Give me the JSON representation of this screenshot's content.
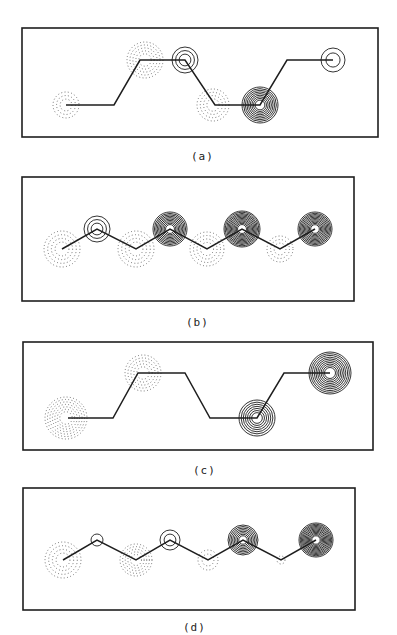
{
  "colors": {
    "ink": "#1e1e1e",
    "dotted": "#555555",
    "background": "#ffffff"
  },
  "panels": [
    {
      "id": "a",
      "label": "(a)",
      "label_pos": [
        191,
        150
      ],
      "box": [
        22,
        28,
        356,
        109
      ],
      "path": [
        [
          66,
          105
        ],
        [
          114,
          105
        ],
        [
          140,
          60
        ],
        [
          185,
          60
        ],
        [
          215,
          105
        ],
        [
          260,
          105
        ],
        [
          287,
          60
        ],
        [
          333,
          60
        ]
      ],
      "atoms": [
        {
          "x": 66,
          "y": 105,
          "phase": "negative",
          "rings": 3,
          "radius": 13
        },
        {
          "x": 145,
          "y": 60,
          "phase": "negative",
          "rings": 5,
          "radius": 18
        },
        {
          "x": 185,
          "y": 60,
          "phase": "positive",
          "rings": 3,
          "radius": 13
        },
        {
          "x": 213,
          "y": 105,
          "phase": "negative",
          "rings": 4,
          "radius": 16
        },
        {
          "x": 260,
          "y": 105,
          "phase": "positive",
          "rings": 9,
          "radius": 18
        },
        {
          "x": 333,
          "y": 60,
          "phase": "positive",
          "rings": 2,
          "radius": 12
        }
      ]
    },
    {
      "id": "b",
      "label": "(b)",
      "label_pos": [
        186,
        316
      ],
      "box": [
        22,
        177,
        332,
        124
      ],
      "path": [
        [
          62,
          249
        ],
        [
          97,
          229
        ],
        [
          136,
          249
        ],
        [
          170,
          229
        ],
        [
          207,
          249
        ],
        [
          242,
          229
        ],
        [
          280,
          249
        ],
        [
          315,
          229
        ]
      ],
      "atoms": [
        {
          "x": 62,
          "y": 249,
          "phase": "negative",
          "rings": 4,
          "radius": 18
        },
        {
          "x": 97,
          "y": 229,
          "phase": "positive",
          "rings": 3,
          "radius": 13
        },
        {
          "x": 136,
          "y": 249,
          "phase": "negative",
          "rings": 4,
          "radius": 18
        },
        {
          "x": 170,
          "y": 229,
          "phase": "positive",
          "rings": 10,
          "radius": 17
        },
        {
          "x": 207,
          "y": 249,
          "phase": "negative",
          "rings": 4,
          "radius": 17
        },
        {
          "x": 242,
          "y": 229,
          "phase": "positive",
          "rings": 12,
          "radius": 18
        },
        {
          "x": 280,
          "y": 249,
          "phase": "negative",
          "rings": 3,
          "radius": 13
        },
        {
          "x": 315,
          "y": 229,
          "phase": "positive",
          "rings": 11,
          "radius": 17
        }
      ]
    },
    {
      "id": "c",
      "label": "(c)",
      "label_pos": [
        193,
        464
      ],
      "box": [
        23,
        342,
        350,
        108
      ],
      "path": [
        [
          68,
          418
        ],
        [
          113,
          418
        ],
        [
          138,
          373
        ],
        [
          185,
          373
        ],
        [
          210,
          418
        ],
        [
          257,
          418
        ],
        [
          284,
          373
        ],
        [
          330,
          373
        ]
      ],
      "atoms": [
        {
          "x": 66,
          "y": 418,
          "phase": "negative",
          "rings": 7,
          "radius": 21
        },
        {
          "x": 143,
          "y": 373,
          "phase": "negative",
          "rings": 5,
          "radius": 18
        },
        {
          "x": 257,
          "y": 418,
          "phase": "positive",
          "rings": 7,
          "radius": 18
        },
        {
          "x": 330,
          "y": 373,
          "phase": "positive",
          "rings": 10,
          "radius": 21
        }
      ]
    },
    {
      "id": "d",
      "label": "(d)",
      "label_pos": [
        183,
        621
      ],
      "box": [
        23,
        488,
        332,
        122
      ],
      "path": [
        [
          63,
          560
        ],
        [
          97,
          540
        ],
        [
          136,
          560
        ],
        [
          170,
          540
        ],
        [
          208,
          560
        ],
        [
          243,
          540
        ],
        [
          281,
          560
        ],
        [
          316,
          540
        ]
      ],
      "atoms": [
        {
          "x": 63,
          "y": 560,
          "phase": "negative",
          "rings": 4,
          "radius": 18
        },
        {
          "x": 97,
          "y": 540,
          "phase": "positive",
          "rings": 1,
          "radius": 6
        },
        {
          "x": 136,
          "y": 560,
          "phase": "negative",
          "rings": 5,
          "radius": 16
        },
        {
          "x": 170,
          "y": 540,
          "phase": "positive",
          "rings": 2,
          "radius": 10
        },
        {
          "x": 208,
          "y": 560,
          "phase": "negative",
          "rings": 2,
          "radius": 10
        },
        {
          "x": 243,
          "y": 540,
          "phase": "positive",
          "rings": 8,
          "radius": 15
        },
        {
          "x": 281,
          "y": 560,
          "phase": "negative",
          "rings": 1,
          "radius": 4
        },
        {
          "x": 316,
          "y": 540,
          "phase": "positive",
          "rings": 12,
          "radius": 17
        }
      ]
    }
  ]
}
